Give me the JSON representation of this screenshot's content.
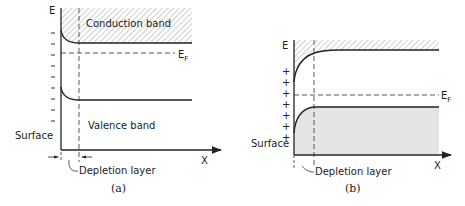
{
  "diagram_a": {
    "caption": "(a)",
    "y_axis_label": "E",
    "x_axis_label": "X",
    "conduction_band_label": "Conduction band",
    "valence_band_label": "Valence band",
    "fermi_label_main": "E",
    "fermi_label_sub": "F",
    "surface_label": "Surface",
    "depletion_label": "Depletion layer",
    "tick_marks": "−"
  },
  "diagram_b": {
    "caption": "(b)",
    "y_axis_label": "E",
    "x_axis_label": "X",
    "fermi_label_main": "E",
    "fermi_label_sub": "F",
    "surface_label": "Surface",
    "depletion_label": "Depletion layer",
    "charge_marks": "+"
  },
  "colors": {
    "line": "#222222",
    "valence_fill_b": "#e4e4e4",
    "hatch": "#777777"
  }
}
